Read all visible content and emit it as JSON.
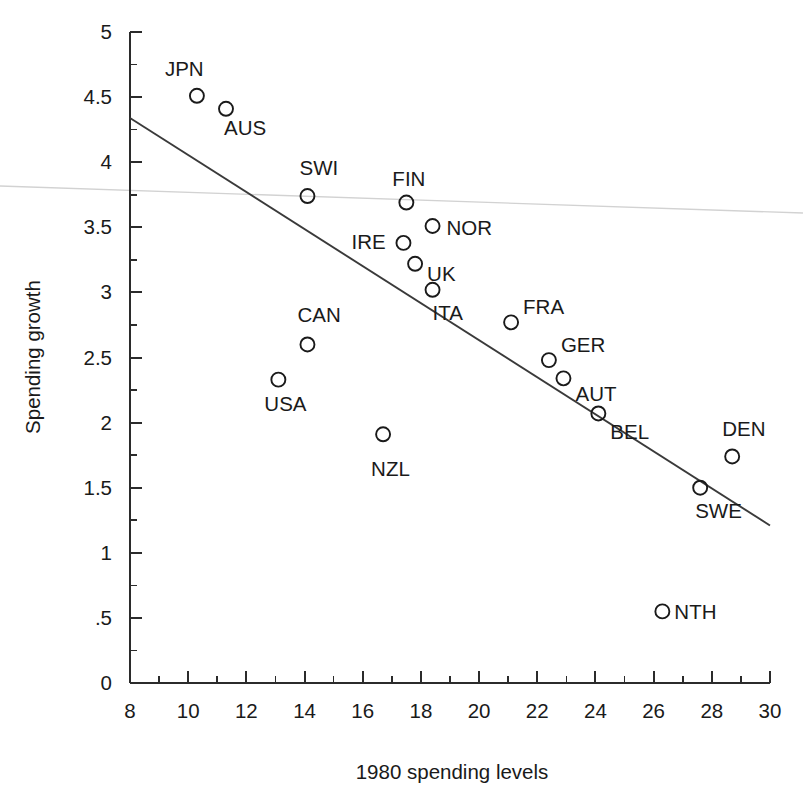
{
  "chart_data": {
    "type": "scatter",
    "title": "",
    "xlabel": "1980 spending levels",
    "ylabel": "Spending growth",
    "xlim": [
      8,
      30
    ],
    "ylim": [
      0,
      5
    ],
    "grid": false,
    "legend": "none",
    "x_ticks": [
      "8",
      "10",
      "12",
      "14",
      "16",
      "18",
      "20",
      "22",
      "24",
      "26",
      "28",
      "30"
    ],
    "x_tick_values": [
      8,
      10,
      12,
      14,
      16,
      18,
      20,
      22,
      24,
      26,
      28,
      30
    ],
    "x_minor_values": [
      9,
      11,
      13,
      15,
      17,
      19,
      21,
      23,
      25,
      27,
      29
    ],
    "y_ticks": [
      "0",
      ".5",
      "1",
      "1.5",
      "2",
      "2.5",
      "3",
      "3.5",
      "4",
      "4.5",
      "5"
    ],
    "y_tick_values": [
      0,
      0.5,
      1,
      1.5,
      2,
      2.5,
      3,
      3.5,
      4,
      4.5,
      5
    ],
    "y_minor_values": [
      0.25,
      0.75,
      1.25,
      1.75,
      2.25,
      2.75,
      3.25,
      3.75,
      4.25,
      4.75
    ],
    "marker_style": "open-circle",
    "marker_radius_px": 7,
    "points": [
      {
        "label": "JPN",
        "x": 10.3,
        "y": 4.51,
        "label_dx": -32,
        "label_dy": -20
      },
      {
        "label": "AUS",
        "x": 11.3,
        "y": 4.41,
        "label_dx": -2,
        "label_dy": 26
      },
      {
        "label": "SWI",
        "x": 14.1,
        "y": 3.74,
        "label_dx": -8,
        "label_dy": -21
      },
      {
        "label": "FIN",
        "x": 17.5,
        "y": 3.69,
        "label_dx": -14,
        "label_dy": -17
      },
      {
        "label": "NOR",
        "x": 18.4,
        "y": 3.51,
        "label_dx": 14,
        "label_dy": 9
      },
      {
        "label": "IRE",
        "x": 17.4,
        "y": 3.38,
        "label_dx": -52,
        "label_dy": 6
      },
      {
        "label": "UK",
        "x": 17.8,
        "y": 3.22,
        "label_dx": 12,
        "label_dy": 17
      },
      {
        "label": "ITA",
        "x": 18.4,
        "y": 3.02,
        "label_dx": 0,
        "label_dy": 30
      },
      {
        "label": "FRA",
        "x": 21.1,
        "y": 2.77,
        "label_dx": 12,
        "label_dy": -8
      },
      {
        "label": "GER",
        "x": 22.4,
        "y": 2.48,
        "label_dx": 12,
        "label_dy": -8
      },
      {
        "label": "AUT",
        "x": 22.9,
        "y": 2.34,
        "label_dx": 12,
        "label_dy": 23
      },
      {
        "label": "BEL",
        "x": 24.1,
        "y": 2.07,
        "label_dx": 12,
        "label_dy": 26
      },
      {
        "label": "DEN",
        "x": 28.7,
        "y": 1.74,
        "label_dx": -10,
        "label_dy": -20
      },
      {
        "label": "SWE",
        "x": 27.6,
        "y": 1.5,
        "label_dx": -5,
        "label_dy": 30
      },
      {
        "label": "CAN",
        "x": 14.1,
        "y": 2.6,
        "label_dx": -10,
        "label_dy": -22
      },
      {
        "label": "USA",
        "x": 13.1,
        "y": 2.33,
        "label_dx": -14,
        "label_dy": 31
      },
      {
        "label": "NZL",
        "x": 16.7,
        "y": 1.91,
        "label_dx": -12,
        "label_dy": 42
      },
      {
        "label": "NTH",
        "x": 26.3,
        "y": 0.55,
        "label_dx": 12,
        "label_dy": 8
      }
    ],
    "fit_line": {
      "name": "regression-line",
      "x0": 8.0,
      "y0": 4.34,
      "x1": 30.0,
      "y1": 1.21
    },
    "scan_artifact_line": {
      "name": "scan-artifact",
      "x0_px": 0,
      "y0_px": 186,
      "x1_px": 803,
      "y1_px": 213
    }
  },
  "colors": {
    "ink": "#1a1a1a",
    "axis": "#2b2b2b",
    "fit": "#3a3a3a",
    "artifact": "#d2d2d2",
    "background": "#ffffff"
  }
}
